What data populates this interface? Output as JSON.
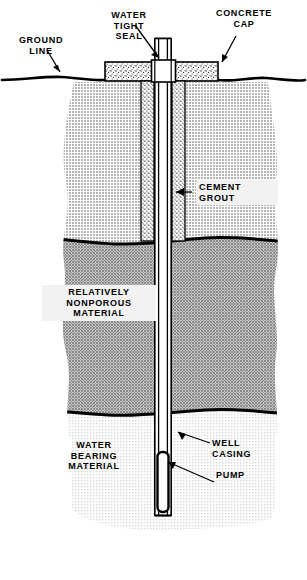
{
  "diagram": {
    "labels": {
      "ground_line": "GROUND\nLINE",
      "water_tight_seal": "WATER\nTIGHT\nSEAL",
      "concrete_cap": "CONCRETE\nCAP",
      "cement_grout": "CEMENT\nGROUT",
      "relatively_nonporous_material": "RELATIVELY\nNONPOROUS\nMATERIAL",
      "water_bearing_material": "WATER\nBEARING\nMATERIAL",
      "well_casing": "WELL\nCASING",
      "pump": "PUMP"
    },
    "layers": [
      {
        "name": "upper-soil",
        "label": "",
        "fill": "#c9c9c9"
      },
      {
        "name": "relatively-nonporous-material",
        "label": "RELATIVELY NONPOROUS MATERIAL",
        "fill": "#a3a3a3"
      },
      {
        "name": "water-bearing-material",
        "label": "WATER BEARING MATERIAL",
        "fill": "#ededed"
      }
    ],
    "colors": {
      "ink": "#000000",
      "paper": "#ffffff",
      "upper_soil": "#c9c9c9",
      "nonporous": "#a3a3a3",
      "water_bearing": "#ededed",
      "concrete": "#f6f6f6",
      "grout": "#f0f0f0",
      "label_box": "#f2f2f2"
    }
  }
}
